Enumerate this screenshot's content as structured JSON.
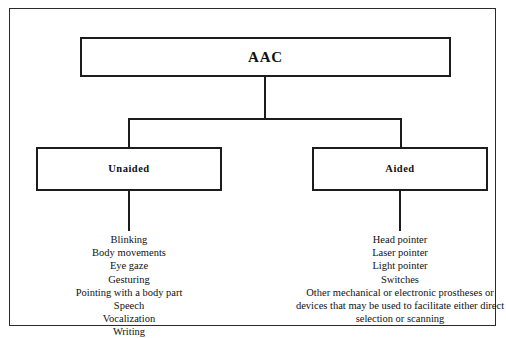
{
  "diagram": {
    "title_node": {
      "label": "AAC"
    },
    "branches": [
      {
        "label": "Unaided",
        "items": [
          "Blinking",
          "Body movements",
          "Eye gaze",
          "Gesturing",
          "Pointing with a body part",
          "Speech",
          "Vocalization",
          "Writing"
        ]
      },
      {
        "label": "Aided",
        "items": [
          "Head pointer",
          "Laser pointer",
          "Light pointer",
          "Switches",
          "Other mechanical or electronic prostheses or devices that may be used to facilitate either direct selection or scanning"
        ]
      }
    ],
    "colors": {
      "line": "#1c1c1c",
      "frame": "#2b2b2b",
      "background": "#ffffff",
      "text": "#111111"
    }
  }
}
